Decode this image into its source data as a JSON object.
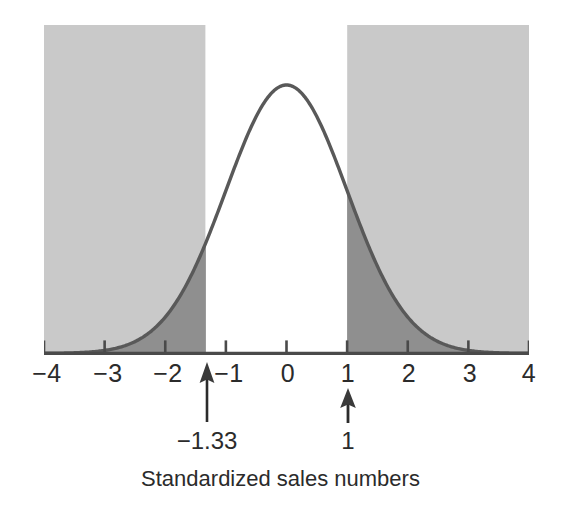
{
  "chart_data": {
    "type": "area",
    "title": "",
    "xlabel": "Standardized sales numbers",
    "ylabel": "",
    "xlim": [
      -4,
      4
    ],
    "ylim": [
      0,
      0.42
    ],
    "grid": false,
    "legend": "none",
    "distribution": "standard normal",
    "mean": 0,
    "sd": 1,
    "curve_label": "normal density curve",
    "x_tick_labels": [
      "−4",
      "−3",
      "−2",
      "−1",
      "0",
      "1",
      "2",
      "3",
      "4"
    ],
    "x_tick_values": [
      -4,
      -3,
      -2,
      -1,
      0,
      1,
      2,
      3,
      4
    ],
    "shaded_regions": [
      {
        "name": "left-tail",
        "from": -4,
        "to": -1.33,
        "fill": "#8f8f8f",
        "label": "shaded left tail below −1.33"
      },
      {
        "name": "right-tail",
        "from": 1,
        "to": 4,
        "fill": "#8f8f8f",
        "label": "shaded right tail above 1"
      }
    ],
    "unshaded_region": {
      "name": "center",
      "from": -1.33,
      "to": 1,
      "fill": "#ffffff"
    },
    "annotations": [
      {
        "name": "lower-cutoff",
        "x": -1.33,
        "label": "−1.33"
      },
      {
        "name": "upper-cutoff",
        "x": 1,
        "label": "1"
      }
    ],
    "colors": {
      "panel_background": "#c9c9c9",
      "tail_fill": "#8f8f8f",
      "center_fill": "#ffffff",
      "curve_stroke": "#595959",
      "axis_stroke": "#4a4a4a",
      "text": "#2b2b2b"
    }
  },
  "axis": {
    "ticks": [
      {
        "label": "−4",
        "value": -4
      },
      {
        "label": "−3",
        "value": -3
      },
      {
        "label": "−2",
        "value": -2
      },
      {
        "label": "−1",
        "value": -1
      },
      {
        "label": "0",
        "value": 0
      },
      {
        "label": "1",
        "value": 1
      },
      {
        "label": "2",
        "value": 2
      },
      {
        "label": "3",
        "value": 3
      },
      {
        "label": "4",
        "value": 4
      }
    ]
  },
  "annotations": {
    "lower": {
      "value": "−1.33"
    },
    "upper": {
      "value": "1"
    }
  },
  "caption": {
    "text": "Standardized sales numbers"
  }
}
